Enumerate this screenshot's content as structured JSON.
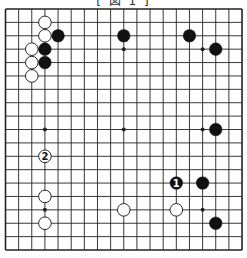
{
  "caption": "[ 図 1 ]",
  "board": {
    "size": 19,
    "x0": 5.5,
    "y0": 9,
    "dx": 13.14,
    "dy": 13.39,
    "line_color": "#222222",
    "stone_black": "#111111",
    "stone_white": "#ffffff"
  },
  "hoshi": [
    [
      3,
      3
    ],
    [
      9,
      3
    ],
    [
      15,
      3
    ],
    [
      3,
      9
    ],
    [
      9,
      9
    ],
    [
      15,
      9
    ],
    [
      3,
      15
    ],
    [
      9,
      15
    ],
    [
      15,
      15
    ]
  ],
  "stones": [
    {
      "color": "white",
      "col": 3,
      "row": 1,
      "label": ""
    },
    {
      "color": "white",
      "col": 3,
      "row": 2,
      "label": ""
    },
    {
      "color": "black",
      "col": 4,
      "row": 2,
      "label": ""
    },
    {
      "color": "white",
      "col": 2,
      "row": 3,
      "label": ""
    },
    {
      "color": "black",
      "col": 3,
      "row": 3,
      "label": ""
    },
    {
      "color": "white",
      "col": 2,
      "row": 4,
      "label": ""
    },
    {
      "color": "black",
      "col": 3,
      "row": 4,
      "label": ""
    },
    {
      "color": "white",
      "col": 2,
      "row": 5,
      "label": ""
    },
    {
      "color": "black",
      "col": 9,
      "row": 2,
      "label": ""
    },
    {
      "color": "black",
      "col": 14,
      "row": 2,
      "label": ""
    },
    {
      "color": "black",
      "col": 16,
      "row": 3,
      "label": ""
    },
    {
      "color": "black",
      "col": 16,
      "row": 9,
      "label": ""
    },
    {
      "color": "white",
      "col": 3,
      "row": 11,
      "label": "2"
    },
    {
      "color": "black",
      "col": 13,
      "row": 13,
      "label": "1"
    },
    {
      "color": "black",
      "col": 15,
      "row": 13,
      "label": ""
    },
    {
      "color": "white",
      "col": 3,
      "row": 14,
      "label": ""
    },
    {
      "color": "white",
      "col": 3,
      "row": 16,
      "label": ""
    },
    {
      "color": "white",
      "col": 9,
      "row": 15,
      "label": ""
    },
    {
      "color": "white",
      "col": 13,
      "row": 15,
      "label": ""
    },
    {
      "color": "black",
      "col": 16,
      "row": 16,
      "label": ""
    }
  ]
}
